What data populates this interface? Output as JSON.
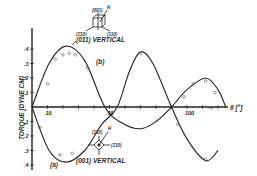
{
  "chart_data": {
    "type": "line",
    "title": "",
    "xlabel": "θ [°]",
    "ylabel": "TORQUE [DYNE CM]",
    "x_tick_labels": [
      "10",
      "50",
      "100"
    ],
    "y_tick_labels": [
      ".4",
      ".3",
      ".2",
      ".1",
      ".1",
      ".2",
      ".3",
      ".4"
    ],
    "xlim": [
      0,
      135
    ],
    "ylim": [
      -0.42,
      0.45
    ],
    "grid": false,
    "series": [
      {
        "name": "(b)",
        "annotation": "(011) VERTICAL",
        "x": [
          0,
          11,
          22,
          34,
          47,
          58,
          70,
          80,
          90,
          100,
          112,
          120,
          125
        ],
        "y": [
          0,
          0.3,
          0.42,
          0.32,
          0,
          -0.11,
          -0.15,
          -0.1,
          0,
          0.12,
          0.2,
          0.12,
          0
        ],
        "points_x": [
          10,
          15,
          20,
          24,
          28,
          36,
          98,
          104,
          112,
          118
        ],
        "points_y": [
          0.16,
          0.33,
          0.36,
          0.37,
          0.36,
          0.27,
          0.07,
          0.16,
          0.18,
          0.1
        ]
      },
      {
        "name": "(a)",
        "annotation": "(001) VERTICAL",
        "x": [
          0,
          11,
          22,
          34,
          45,
          55,
          63,
          70,
          78,
          90,
          100,
          112,
          120
        ],
        "y": [
          0,
          -0.3,
          -0.38,
          -0.3,
          -0.12,
          0,
          0.25,
          0.38,
          0.3,
          0,
          -0.22,
          -0.37,
          -0.3
        ],
        "points_x": [
          5,
          18,
          26,
          70,
          94,
          112
        ],
        "points_y": [
          -0.14,
          -0.33,
          -0.32,
          0.37,
          -0.12,
          -0.36
        ]
      }
    ],
    "annotations": [
      "(011) VERTICAL",
      "(b)",
      "(001) VERTICAL",
      "(a)"
    ]
  },
  "labels": {
    "y_axis": "TORQUE [DYNE CM]",
    "x_axis": "θ [°]",
    "top_curve": "(011) VERTICAL",
    "top_series": "(b)",
    "bottom_curve": "(001) VERTICAL",
    "bottom_series": "(a)",
    "inset_top": {
      "top": "(001)",
      "left": "(1̄10)",
      "right": "(110)",
      "field": "H"
    },
    "inset_bottom": {
      "top": "(110)",
      "right": "(1̄10)",
      "field": "H"
    }
  }
}
